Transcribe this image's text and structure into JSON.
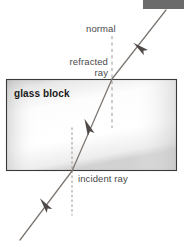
{
  "figure": {
    "width": 184,
    "height": 247,
    "background": "#ffffff"
  },
  "labels": {
    "normal": "normal",
    "refracted_line1": "refracted",
    "refracted_line2": "ray",
    "glass_block": "glass block",
    "incident": "incident ray"
  },
  "colors": {
    "text": "#4a4a4a",
    "text_bold": "#1a1a1a",
    "ray": "#77706c",
    "arrow": "#4f4a47",
    "block_border": "#3a3a3a",
    "normal_dash": "#9a9a9a",
    "normal_dot": "#b0a9a4",
    "corner_tab": "#6b6b6b",
    "block_fill_light": "#fefefe",
    "block_fill_dark": "#c9c9c9"
  },
  "geometry": {
    "block": {
      "x": 6,
      "y": 79,
      "width": 171,
      "height": 92
    },
    "corner_tab": {
      "x": 143,
      "y": 0,
      "width": 41,
      "height": 9
    },
    "ray": {
      "incident_start": {
        "x": 20,
        "y": 240
      },
      "entry_point": {
        "x": 72,
        "y": 171
      },
      "exit_point": {
        "x": 112,
        "y": 79
      },
      "emergent_end": {
        "x": 166,
        "y": 10
      }
    },
    "normal_upper": {
      "x": 112,
      "y_top": 36,
      "y_bottom": 128
    },
    "normal_lower": {
      "x": 72,
      "y_top": 128,
      "y_bottom": 215
    },
    "arrows": [
      {
        "name": "emergent-ray-arrow",
        "x": 140,
        "y": 48
      },
      {
        "name": "refracted-ray-arrow",
        "x": 88,
        "y": 127
      },
      {
        "name": "incident-ray-arrow",
        "x": 45,
        "y": 205
      }
    ]
  }
}
